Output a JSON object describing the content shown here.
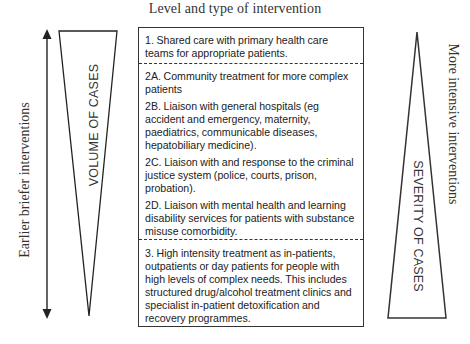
{
  "diagram": {
    "title": "Level and type of intervention",
    "left_axis_label": "Earlier briefer interventions",
    "right_axis_label": "More intensive interventions",
    "left_triangle_label": "VOLUME OF CASES",
    "right_triangle_label": "SEVERITY OF CASES",
    "levels": [
      {
        "id": "1",
        "items": [
          "1. Shared care with primary health care teams for appropriate patients."
        ]
      },
      {
        "id": "2",
        "items": [
          "2A. Community treatment for more complex patients",
          "2B. Liaison with general hospitals (eg accident and emergency, maternity, paediatrics, communicable diseases, hepatobiliary medicine).",
          "2C. Liaison with and response to the criminal justice system (police, courts, prison, probation).",
          "2D. Liaison with mental health and learning disability services for patients with substance misuse comorbidity."
        ]
      },
      {
        "id": "3",
        "items": [
          "3. High intensity treatment as in-patients, outpatients or day patients for people with high levels of complex needs. This includes structured drug/alcohol treatment clinics and specialist in-patient detoxification and recovery programmes."
        ]
      }
    ],
    "colors": {
      "line": "#333333",
      "text": "#222222",
      "background": "#ffffff"
    }
  }
}
